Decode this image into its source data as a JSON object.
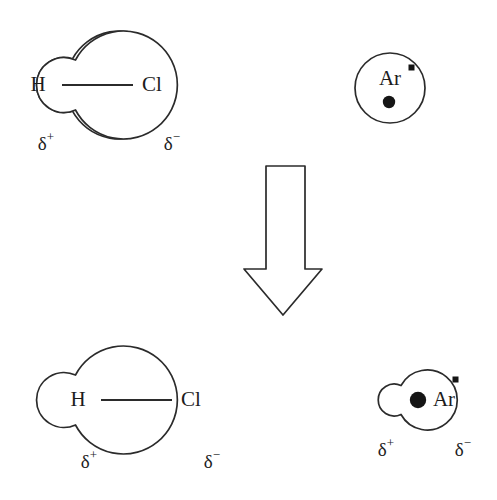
{
  "figure": {
    "background_color": "#ffffff",
    "stroke_color": "#2b2b2b",
    "fill_color": "#1c1c1c"
  },
  "top_row": {
    "hcl": {
      "name": "hydrogen-chloride-molecule",
      "h_label": "H",
      "cl_label": "Cl",
      "delta_positive": "δ",
      "delta_positive_sign": "+",
      "delta_negative": "δ",
      "delta_negative_sign": "−"
    },
    "argon": {
      "name": "argon-atom-symmetric",
      "label": "Ar",
      "nucleus": "nucleus-dot",
      "electron": "electron-dot"
    }
  },
  "arrow": {
    "name": "down-arrow",
    "direction": "down",
    "style": "hollow-outline"
  },
  "bottom_row": {
    "hcl": {
      "name": "hydrogen-chloride-molecule",
      "h_label": "H",
      "cl_label": "Cl",
      "delta_positive": "δ",
      "delta_positive_sign": "+",
      "delta_negative": "δ",
      "delta_negative_sign": "−"
    },
    "argon": {
      "name": "argon-atom-polarized",
      "label": "Ar",
      "nucleus": "nucleus-dot",
      "electron": "electron-dot",
      "delta_positive": "δ",
      "delta_positive_sign": "+",
      "delta_negative": "δ",
      "delta_negative_sign": "−"
    }
  }
}
